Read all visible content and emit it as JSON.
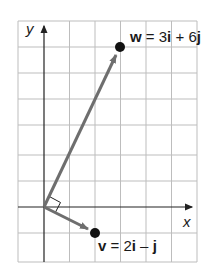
{
  "diagram": {
    "type": "vector-plot",
    "axes": {
      "x_label": "x",
      "y_label": "y"
    },
    "grid": {
      "x_range": [
        -1,
        6
      ],
      "y_range": [
        -2,
        7
      ],
      "spacing": 1
    },
    "vectors": [
      {
        "name": "w",
        "components": [
          3,
          6
        ],
        "label_bold": "w",
        "label_rest": " = 3",
        "i": "i",
        "plus": " + 6",
        "j": "j"
      },
      {
        "name": "v",
        "components": [
          2,
          -1
        ],
        "label_bold": "v",
        "label_rest": " = 2",
        "i": "i",
        "minus": " – ",
        "j": "j"
      }
    ],
    "annotation": "right-angle marker at origin",
    "colors": {
      "grid": "#bdbdbd",
      "axis": "#222222",
      "vector": "#6e6e6e",
      "point": "#111111"
    }
  }
}
